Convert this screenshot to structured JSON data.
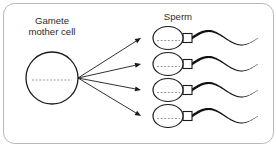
{
  "figure": {
    "background_color": "#ffffff",
    "border_color": "#b9b9b9",
    "ink_color": "#1a1a1a",
    "dash_color": "#9a9a9a",
    "frame": {
      "x": 3,
      "y": 3,
      "width": 270,
      "height": 140,
      "radius": 11
    }
  },
  "labels": {
    "mother_cell_line1": "Gamete",
    "mother_cell_line2": "mother cell",
    "sperm": "Sperm"
  },
  "mother_cell": {
    "name": "gamete-mother-cell",
    "center_x": 52,
    "center_y": 78,
    "radius": 26,
    "fill": "#ffffff",
    "stroke": "#1a1a1a",
    "stroke_width": 1.3,
    "nucleus_line": {
      "x1": 32,
      "x2": 72,
      "y": 80,
      "dash": "2,1.6"
    }
  },
  "arrows": {
    "name": "division-arrows",
    "origin_x": 78,
    "origin_y": 78,
    "count": 4,
    "stroke": "#1a1a1a",
    "stroke_width": 0.9,
    "head_length": 6,
    "head_width": 5,
    "targets_y": [
      38,
      64,
      90,
      116
    ],
    "target_x": 141
  },
  "sperm_cells": [
    {
      "id": 1,
      "center_y": 38,
      "head_center_x": 168
    },
    {
      "id": 2,
      "center_y": 64,
      "head_center_x": 168
    },
    {
      "id": 3,
      "center_y": 90,
      "head_center_x": 168
    },
    {
      "id": 4,
      "center_y": 116,
      "head_center_x": 168
    }
  ],
  "sperm_shape": {
    "head_rx": 15,
    "head_ry": 11.5,
    "head_fill": "#ffffff",
    "head_stroke": "#1a1a1a",
    "head_stroke_width": 1.2,
    "nucleus_dash": "2,1.6",
    "nucleus_x1": 157,
    "nucleus_x2": 180,
    "midpiece": {
      "x": 183,
      "width": 9,
      "height": 9,
      "fill": "#ffffff",
      "stroke": "#1a1a1a",
      "stroke_width": 1.1
    },
    "tail": {
      "start_x": 192,
      "end_x": 258,
      "amplitude": 7,
      "base_width": 3.2,
      "tip_width": 0.35,
      "fill": "#111111"
    }
  },
  "label_positions": {
    "mother_cell_x": 52,
    "mother_cell_y1": 24,
    "mother_cell_y2": 35,
    "sperm_x": 178,
    "sperm_y": 20
  }
}
